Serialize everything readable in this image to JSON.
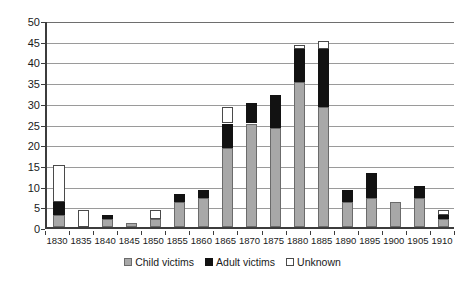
{
  "chart_data": {
    "type": "bar",
    "stacked": true,
    "title": "",
    "subtitle": "",
    "xlabel": "",
    "ylabel": "",
    "ylim": [
      0,
      50
    ],
    "ytick_step": 5,
    "yticks": [
      0,
      5,
      10,
      15,
      20,
      25,
      30,
      35,
      40,
      45,
      50
    ],
    "ytick_labels": [
      "0",
      "5",
      "10",
      "15",
      "20",
      "25",
      "30",
      "35",
      "40",
      "45",
      "50"
    ],
    "grid": true,
    "grid_axis": "y",
    "legend_position": "bottom",
    "categories": [
      "1830",
      "1835",
      "1840",
      "1845",
      "1850",
      "1855",
      "1860",
      "1865",
      "1870",
      "1875",
      "1880",
      "1885",
      "1890",
      "1895",
      "1900",
      "1905",
      "1910"
    ],
    "series": [
      {
        "name": "Child victims",
        "color": "#a8a8a8",
        "values": [
          3,
          0,
          2,
          1,
          2,
          6,
          7,
          19,
          25,
          24,
          35,
          29,
          6,
          7,
          6,
          7,
          2
        ]
      },
      {
        "name": "Adult victims",
        "color": "#121212",
        "values": [
          3,
          0,
          1,
          0,
          0,
          2,
          2,
          6,
          5,
          8,
          8,
          14,
          3,
          6,
          0,
          3,
          1
        ]
      },
      {
        "name": "Unknown",
        "color": "#ffffff",
        "values": [
          9,
          4,
          0,
          0,
          2,
          0,
          0,
          4,
          0,
          0,
          1,
          2,
          0,
          0,
          0,
          0,
          1
        ]
      }
    ],
    "totals": [
      15,
      4,
      3,
      1,
      4,
      8,
      9,
      29,
      30,
      32,
      44,
      45,
      9,
      13,
      6,
      10,
      4
    ]
  },
  "legend": {
    "items": [
      {
        "label": "Child victims",
        "swatch": "child"
      },
      {
        "label": "Adult victims",
        "swatch": "adult"
      },
      {
        "label": "Unknown",
        "swatch": "unknown"
      }
    ]
  }
}
